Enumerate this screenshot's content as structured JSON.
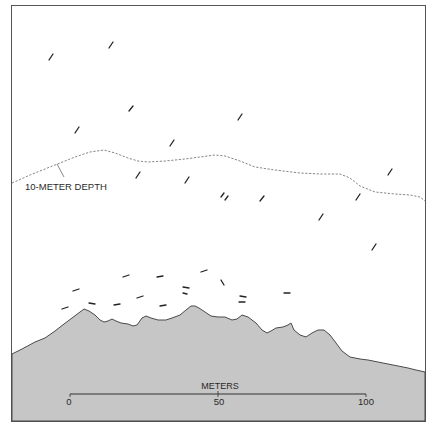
{
  "diagram": {
    "colors": {
      "background": "#ffffff",
      "frame": "#555555",
      "ground_fill": "#c6c6c6",
      "ground_outline": "#4a4a4a",
      "fish": "#222222",
      "depth_line": "#666666"
    },
    "depth_contour": {
      "label": "10-METER DEPTH",
      "style": "dashed"
    },
    "scale_bar": {
      "title": "METERS",
      "ticks": [
        "0",
        "50",
        "100"
      ]
    },
    "fish": {
      "upper_water_count": 20,
      "near_bottom_count": 19,
      "upper_positions": [
        [
          51,
          57
        ],
        [
          111,
          45
        ],
        [
          131,
          109
        ],
        [
          77,
          130
        ],
        [
          172,
          143
        ],
        [
          240,
          117
        ],
        [
          138,
          175
        ],
        [
          187,
          180
        ],
        [
          223,
          195
        ],
        [
          227,
          198
        ],
        [
          262,
          198
        ],
        [
          321,
          217
        ],
        [
          358,
          197
        ],
        [
          390,
          172
        ],
        [
          374,
          247
        ]
      ],
      "bottom_positions": [
        [
          76,
          290
        ],
        [
          65,
          308
        ],
        [
          92,
          303
        ],
        [
          117,
          305
        ],
        [
          126,
          276
        ],
        [
          160,
          276
        ],
        [
          140,
          297
        ],
        [
          163,
          305
        ],
        [
          186,
          288
        ],
        [
          184,
          293
        ],
        [
          204,
          271
        ],
        [
          222,
          282
        ],
        [
          243,
          296
        ],
        [
          242,
          302
        ],
        [
          287,
          293
        ]
      ]
    }
  }
}
